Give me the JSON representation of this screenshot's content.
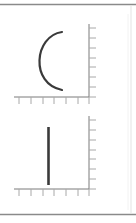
{
  "page": {
    "type": "line-diagram-card",
    "colors": {
      "background": "#ffffff",
      "border": "#8a8a8a",
      "axis": "#7a7a7a",
      "tick": "#a0a0a0",
      "stroke": "#3a3a3a",
      "edge": "#e6e6e6"
    }
  },
  "diagrams": [
    {
      "id": "top",
      "shape": "left-facing arc",
      "axes": {
        "y_axis_ticks": 8,
        "x_axis_ticks": 7
      }
    },
    {
      "id": "bottom",
      "shape": "vertical line",
      "axes": {
        "y_axis_ticks": 8,
        "x_axis_ticks": 7
      }
    }
  ]
}
